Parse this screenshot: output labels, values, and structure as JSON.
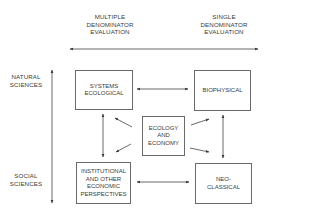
{
  "diagram": {
    "axes": {
      "horizontal": {
        "left_label": "MULTIPLE\nDENOMINATOR\nEVALUATION",
        "right_label": "SINGLE\nDENOMINATOR\nEVALUATION"
      },
      "vertical": {
        "top_label": "NATURAL\nSCIENCES",
        "bottom_label": "SOCIAL\nSCIENCES"
      }
    },
    "boxes": {
      "top_left": "SYSTEMS\nECOLOGICAL",
      "top_right": "BIOPHYSICAL",
      "center": "ECOLOGY\nAND\nECONOMY",
      "bottom_left": "INSTITUTIONAL\nAND OTHER\nECONOMIC\nPERSPECTIVES",
      "bottom_right": "NEO-\nCLASSICAL"
    },
    "colors": {
      "line": "#5a5a5a",
      "text": "#3a3a3a",
      "background": "#ffffff"
    }
  }
}
